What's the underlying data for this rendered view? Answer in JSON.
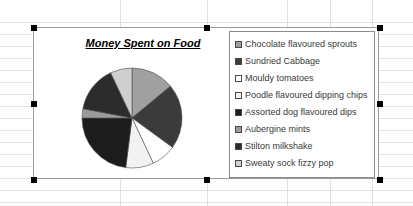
{
  "app": {
    "surface": "spreadsheet-canvas",
    "selection_state": "chart-selected"
  },
  "background": {
    "grid_rows_y": [
      22,
      34,
      46,
      58,
      70,
      82,
      94,
      106,
      118,
      130,
      142,
      154,
      166,
      178,
      190,
      202
    ],
    "grid_cols_x": [
      120,
      207,
      287,
      330,
      372
    ]
  },
  "chart_object": {
    "selection_handles": [
      {
        "name": "handle-top-left",
        "x": 0,
        "y": 0
      },
      {
        "name": "handle-top-center",
        "x": 50,
        "y": 0
      },
      {
        "name": "handle-top-right",
        "x": 100,
        "y": 0
      },
      {
        "name": "handle-middle-left",
        "x": 0,
        "y": 50
      },
      {
        "name": "handle-middle-right",
        "x": 100,
        "y": 50
      },
      {
        "name": "handle-bottom-left",
        "x": 0,
        "y": 100
      },
      {
        "name": "handle-bottom-center",
        "x": 50,
        "y": 100
      },
      {
        "name": "handle-bottom-right",
        "x": 100,
        "y": 100
      }
    ]
  },
  "chart_data": {
    "type": "pie",
    "title": "Money Spent on Food",
    "xlabel": "",
    "ylabel": "",
    "legend_position": "right",
    "grid": false,
    "categories": [
      "Chocolate flavoured sprouts",
      "Sundried Cabbage",
      "Mouldy tomatoes",
      "Poodle flavoured dipping chips",
      "Assorted dog flavoured dips",
      "Aubergine mints",
      "Stilton milkshake",
      "Sweaty sock fizzy pop"
    ],
    "values": [
      14,
      21,
      8,
      9,
      23,
      3,
      15,
      7
    ],
    "colors": [
      "#a0a0a0",
      "#3b3b3b",
      "#ffffff",
      "#f2f2f2",
      "#1c1c1c",
      "#9b9b9b",
      "#2c2c2c",
      "#cfcfcf"
    ],
    "slice_start_angle": 0,
    "slice_direction": "clockwise"
  },
  "legend": {
    "items": [
      {
        "label": "Chocolate flavoured sprouts",
        "color": "#a0a0a0"
      },
      {
        "label": "Sundried Cabbage",
        "color": "#3b3b3b"
      },
      {
        "label": "Mouldy tomatoes",
        "color": "#ffffff"
      },
      {
        "label": "Poodle flavoured dipping chips",
        "color": "#f2f2f2"
      },
      {
        "label": "Assorted dog flavoured dips",
        "color": "#1c1c1c"
      },
      {
        "label": "Aubergine mints",
        "color": "#9b9b9b"
      },
      {
        "label": "Stilton milkshake",
        "color": "#2c2c2c"
      },
      {
        "label": "Sweaty sock fizzy pop",
        "color": "#cfcfcf"
      }
    ]
  }
}
